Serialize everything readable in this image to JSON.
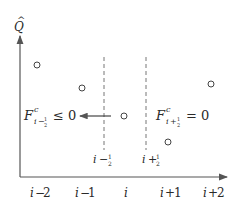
{
  "diagram": {
    "y_axis_label": "Q",
    "y_axis_hat": "^",
    "x_ticks": [
      {
        "var": "i",
        "op": "−",
        "num": "2"
      },
      {
        "var": "i",
        "op": "−",
        "num": "1"
      },
      {
        "var": "i",
        "op": "",
        "num": ""
      },
      {
        "var": "i",
        "op": "+",
        "num": "1"
      },
      {
        "var": "i",
        "op": "+",
        "num": "2"
      }
    ],
    "interfaces": [
      {
        "var": "i",
        "op": "−",
        "frac_num": "1",
        "frac_den": "2"
      },
      {
        "var": "i",
        "op": "+",
        "frac_num": "1",
        "frac_den": "2"
      }
    ],
    "flux_left": {
      "symbol": "F",
      "superscript": "c",
      "sub_var": "i",
      "sub_op": "−",
      "sub_frac_num": "1",
      "sub_frac_den": "2",
      "relation": "≤ 0"
    },
    "flux_right": {
      "symbol": "F",
      "superscript": "c",
      "sub_var": "i",
      "sub_op": "+",
      "sub_frac_num": "1",
      "sub_frac_den": "2",
      "relation": "= 0"
    },
    "cell_values": [
      "i-2",
      "i-1",
      "i",
      "i+1",
      "i+2"
    ],
    "colors": {
      "axis": "#555555",
      "text": "#2a2a2a",
      "dashed": "#777777",
      "marker": "#444444"
    }
  }
}
